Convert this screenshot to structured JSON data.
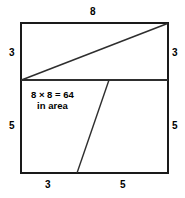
{
  "figure": {
    "area_text": {
      "line1": "8 × 8 = 64",
      "line2": "in area"
    },
    "labels": {
      "top": "8",
      "left_upper": "3",
      "right_upper": "3",
      "left_lower": "5",
      "right_lower": "5",
      "bottom_left": "3",
      "bottom_right": "5"
    },
    "colors": {
      "stroke": "#1a1a1a",
      "thin_stroke": "#3a3a3a",
      "background": "#ffffff",
      "text": "#000000"
    },
    "geometry": {
      "square": {
        "x": 21,
        "y": 23,
        "width": 147,
        "height": 150
      },
      "horizontal_cut_y": 80,
      "diagonal": {
        "x1": 21,
        "y1": 80,
        "x2": 168,
        "y2": 23
      },
      "slant": {
        "x1": 109,
        "y1": 80,
        "x2": 77,
        "y2": 173
      }
    }
  }
}
